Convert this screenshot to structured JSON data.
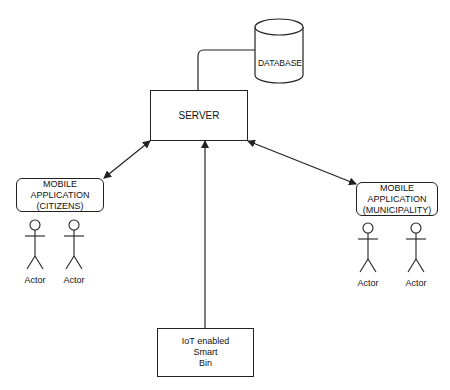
{
  "diagram": {
    "type": "system-architecture",
    "nodes": {
      "database": {
        "label": "DATABASE",
        "shape": "cylinder"
      },
      "server": {
        "label": "SERVER",
        "shape": "rectangle"
      },
      "app_citizens": {
        "label": "MOBILE\nAPPLICATION\n(CITIZENS)",
        "shape": "rounded-rectangle"
      },
      "app_municipality": {
        "label": "MOBILE\nAPPLICATION\n(MUNICIPALITY)",
        "shape": "rounded-rectangle"
      },
      "iot_bin": {
        "label": "IoT enabled\nSmart\nBin",
        "shape": "rectangle"
      }
    },
    "actors": {
      "citizens": [
        {
          "label": "Actor"
        },
        {
          "label": "Actor"
        }
      ],
      "municipality": [
        {
          "label": "Actor"
        },
        {
          "label": "Actor"
        }
      ]
    },
    "edges": [
      {
        "from": "server",
        "to": "database",
        "style": "line"
      },
      {
        "from": "server",
        "to": "app_citizens",
        "style": "bidirectional-arrow"
      },
      {
        "from": "server",
        "to": "app_municipality",
        "style": "bidirectional-arrow"
      },
      {
        "from": "iot_bin",
        "to": "server",
        "style": "arrow"
      }
    ],
    "colors": {
      "stroke": "#222222",
      "background": "#ffffff"
    }
  }
}
